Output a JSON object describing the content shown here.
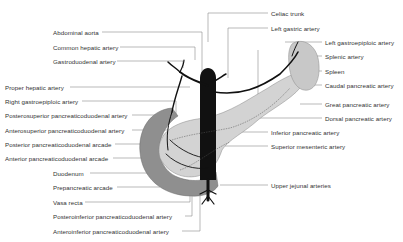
{
  "diagram": {
    "labels_left": [
      {
        "text": "Abdominal aorta",
        "x": 53,
        "y": 29
      },
      {
        "text": "Common hepatic artery",
        "x": 53,
        "y": 44
      },
      {
        "text": "Gastroduodenal artery",
        "x": 53,
        "y": 58
      },
      {
        "text": "Proper hepatic artery",
        "x": 5,
        "y": 84
      },
      {
        "text": "Right gastroepiploic artery",
        "x": 5,
        "y": 98
      },
      {
        "text": "Posterosuperior pancreaticoduodenal artery",
        "x": 5,
        "y": 112
      },
      {
        "text": "Anterosuperior pancreaticoduodenal artery",
        "x": 5,
        "y": 127
      },
      {
        "text": "Posterior pancreaticoduodenal arcade",
        "x": 5,
        "y": 141
      },
      {
        "text": "Anterior pancreaticoduodenal arcade",
        "x": 5,
        "y": 155
      },
      {
        "text": "Duodenum",
        "x": 53,
        "y": 170
      },
      {
        "text": "Prepancreatic arcade",
        "x": 53,
        "y": 184
      },
      {
        "text": "Vasa recta",
        "x": 53,
        "y": 199
      },
      {
        "text": "Posteroinferior pancreaticoduodenal artery",
        "x": 53,
        "y": 213
      },
      {
        "text": "Anteroinferior pancreaticoduodenal artery",
        "x": 53,
        "y": 228
      }
    ],
    "labels_right": [
      {
        "text": "Celiac trunk",
        "x": 271,
        "y": 10
      },
      {
        "text": "Left gastric artery",
        "x": 271,
        "y": 25
      },
      {
        "text": "Left gastroepiploic artery",
        "x": 325,
        "y": 39
      },
      {
        "text": "Splenic artery",
        "x": 325,
        "y": 53
      },
      {
        "text": "Spleen",
        "x": 325,
        "y": 68
      },
      {
        "text": "Caudal pancreatic artery",
        "x": 325,
        "y": 82
      },
      {
        "text": "Great pancreatic artery",
        "x": 325,
        "y": 101
      },
      {
        "text": "Dorsal pancreatic artery",
        "x": 325,
        "y": 115
      },
      {
        "text": "Inferior pancreatic artery",
        "x": 271,
        "y": 129
      },
      {
        "text": "Superior mesenteric artery",
        "x": 271,
        "y": 143
      },
      {
        "text": "Upper jejunal arteries",
        "x": 271,
        "y": 182
      }
    ]
  }
}
